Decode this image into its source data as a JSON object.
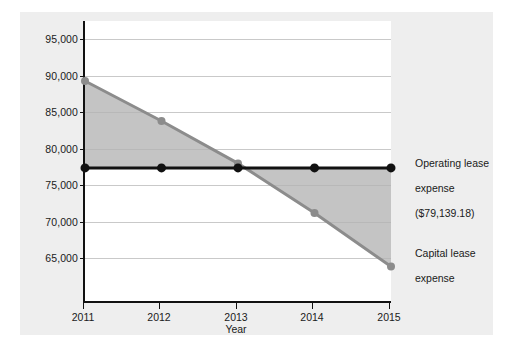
{
  "chart_data": {
    "type": "line",
    "title": "",
    "xlabel": "Year",
    "ylabel": "Annual lease expense ($)",
    "categories": [
      "2011",
      "2012",
      "2013",
      "2014",
      "2015"
    ],
    "x": [
      2011,
      2012,
      2013,
      2014,
      2015
    ],
    "xlim": [
      2011,
      2015
    ],
    "ylim": [
      62500,
      97500
    ],
    "yticks": [
      "95,000",
      "90,000",
      "85,000",
      "80,000",
      "75,000",
      "70,000",
      "65,000"
    ],
    "ytick_values": [
      95000,
      90000,
      85000,
      80000,
      75000,
      70000,
      65000
    ],
    "grid": true,
    "legend_position": "right-annotations",
    "series": [
      {
        "name": "Operating lease expense",
        "color": "#111111",
        "values": [
          79139.18,
          79139.18,
          79139.18,
          79139.18,
          79139.18
        ],
        "annotation": "Operating lease\nexpense\n($79,139.18)"
      },
      {
        "name": "Capital lease expense",
        "color": "#8c8c8c",
        "values": [
          90000,
          85000,
          79700,
          73500,
          66800
        ],
        "annotation": "Capital lease\nexpense"
      }
    ],
    "fill_between": {
      "series_a": "Capital lease expense",
      "series_b": "Operating lease expense",
      "color": "#b3b3b3",
      "opacity": 0.75
    }
  },
  "axis": {
    "ytitle": "Annual lease expense ($)",
    "xtitle": "Year",
    "ytick_labels": [
      "95,000",
      "90,000",
      "85,000",
      "80,000",
      "75,000",
      "70,000",
      "65,000"
    ],
    "xtick_labels": [
      "2011",
      "2012",
      "2013",
      "2014",
      "2015"
    ]
  },
  "annotations": {
    "operating": {
      "line1": "Operating lease",
      "line2": "expense",
      "line3": "($79,139.18)"
    },
    "capital": {
      "line1": "Capital lease",
      "line2": "expense"
    }
  },
  "colors": {
    "figure_background": "#eeeeee",
    "plot_background": "#ffffff",
    "grid": "#c9c9c9",
    "axis": "#111111",
    "operating_line": "#111111",
    "capital_line": "#8c8c8c",
    "shaded_area": "#b3b3b3"
  }
}
